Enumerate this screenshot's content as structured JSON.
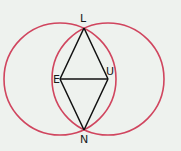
{
  "diagram": {
    "background": "#eef2ee",
    "circle_color": "#d0455e",
    "line_color": "#111111",
    "points": {
      "L": {
        "label": "L",
        "x": 84,
        "y": 28
      },
      "E": {
        "label": "E",
        "x": 60,
        "y": 79
      },
      "U": {
        "label": "U",
        "x": 108,
        "y": 79
      },
      "N": {
        "label": "N",
        "x": 84,
        "y": 130
      }
    },
    "circles": [
      {
        "name": "circle-centered-E",
        "cx": 60,
        "cy": 79,
        "r": 56
      },
      {
        "name": "circle-centered-U",
        "cx": 108,
        "cy": 79,
        "r": 56
      }
    ],
    "segments": [
      "LE",
      "LU",
      "EU",
      "EN",
      "UN"
    ]
  }
}
